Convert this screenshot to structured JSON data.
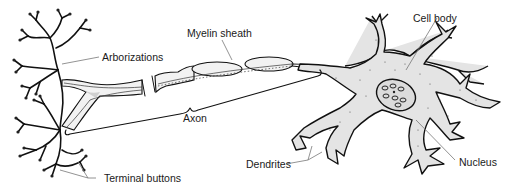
{
  "diagram": {
    "colors": {
      "ink": "#111111",
      "cytoplasm": "#e4e4e4",
      "sheath": "#f2f2f2",
      "leader": "#777777",
      "text": "#1a1a1a"
    },
    "labels": {
      "arborizations": "Arborizations",
      "myelin_sheath": "Myelin sheath",
      "axon": "Axon",
      "terminal_buttons": "Terminal buttons",
      "dendrites": "Dendrites",
      "cell_body": "Cell body",
      "nucleus": "Nucleus"
    }
  }
}
